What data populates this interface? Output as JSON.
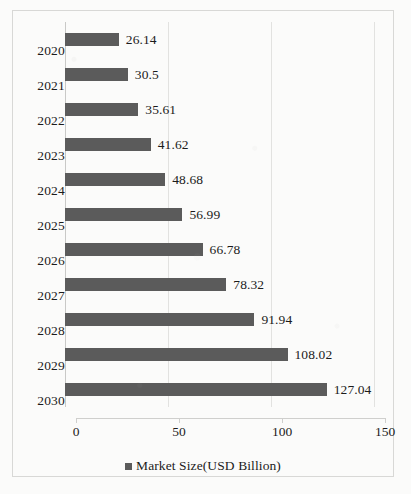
{
  "chart_data": {
    "type": "bar",
    "orientation": "horizontal",
    "title": "",
    "xlabel": "",
    "ylabel": "",
    "categories": [
      "2020",
      "2021",
      "2022",
      "2023",
      "2024",
      "2025",
      "2026",
      "2027",
      "2028",
      "2029",
      "2030"
    ],
    "values": [
      26.14,
      30.5,
      35.61,
      41.62,
      48.68,
      56.99,
      66.78,
      78.32,
      91.94,
      108.02,
      127.04
    ],
    "value_labels": [
      "26.14",
      "30.5",
      "35.61",
      "41.62",
      "48.68",
      "56.99",
      "66.78",
      "78.32",
      "91.94",
      "108.02",
      "127.04"
    ],
    "series": [
      {
        "name": "Market Size(USD Billion)",
        "color": "#5b5b5b",
        "values": [
          26.14,
          30.5,
          35.61,
          41.62,
          48.68,
          56.99,
          66.78,
          78.32,
          91.94,
          108.02,
          127.04
        ]
      }
    ],
    "xlim": [
      0,
      150
    ],
    "xticks": [
      0,
      50,
      100,
      150
    ],
    "xtick_labels": [
      "0",
      "50",
      "100",
      "150"
    ],
    "grid": true,
    "grid_axis": "x",
    "legend": {
      "position": "bottom",
      "entries": [
        {
          "label": "Market Size(USD Billion)",
          "color": "#5b5b5b"
        }
      ]
    },
    "colors": {
      "bar": "#5b5b5b",
      "gridline": "#e2e2e0",
      "axis": "#cfcfcd",
      "border": "#d8d8d6",
      "background": "#fbfbfa",
      "text": "#1b1b1b"
    }
  }
}
